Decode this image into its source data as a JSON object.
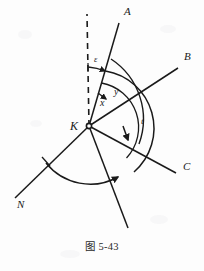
{
  "figure": {
    "caption": "图 5-43",
    "vertex": {
      "label": "K",
      "x": 89,
      "y": 126
    },
    "stroke_color": "#1a1a1a",
    "background_color": "#fdfdfd",
    "rays": [
      {
        "name": "ray-a",
        "label": "A",
        "label_x": 124,
        "label_y": 15,
        "end_x": 119,
        "end_y": 23,
        "dashed": false
      },
      {
        "name": "ray-b",
        "label": "B",
        "label_x": 184,
        "label_y": 60,
        "end_x": 178,
        "end_y": 68,
        "dashed": false
      },
      {
        "name": "ray-c",
        "label": "C",
        "label_x": 183,
        "label_y": 170,
        "end_x": 176,
        "end_y": 173,
        "dashed": false
      },
      {
        "name": "ray-n",
        "label": "N",
        "label_x": 17,
        "label_y": 208,
        "end_x": 15,
        "end_y": 198,
        "dashed": false
      },
      {
        "name": "ray-unlabeled-lower-right",
        "label": "",
        "label_x": 0,
        "label_y": 0,
        "end_x": 128,
        "end_y": 228,
        "dashed": false
      },
      {
        "name": "reference-dashed-line",
        "label": "",
        "label_x": 0,
        "label_y": 0,
        "end_x": 87,
        "end_y": 14,
        "dashed": true
      }
    ],
    "angles": [
      {
        "name": "angle-epsilon",
        "label": "ε",
        "label_x": 94,
        "label_y": 62
      },
      {
        "name": "angle-x",
        "label": "x",
        "label_x": 100,
        "label_y": 106
      },
      {
        "name": "angle-y",
        "label": "y",
        "label_x": 114,
        "label_y": 95
      },
      {
        "name": "angle-t",
        "label": "t",
        "label_x": 141,
        "label_y": 124
      }
    ]
  }
}
